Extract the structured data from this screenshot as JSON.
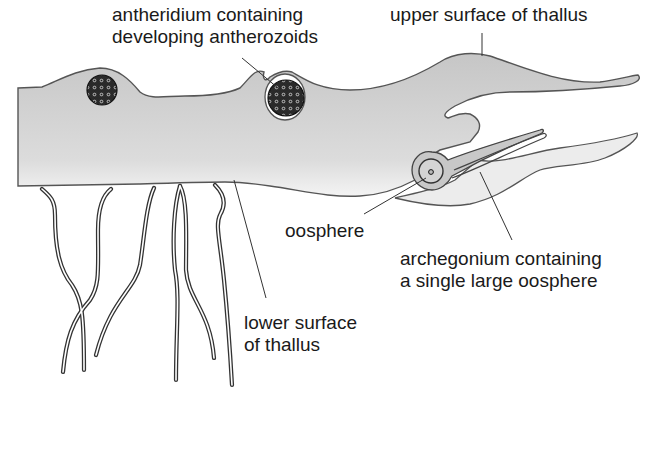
{
  "diagram": {
    "type": "biological-diagram",
    "colors": {
      "thallus_fill_top": "#c9c9c9",
      "thallus_fill_bottom": "#f2f2f2",
      "outline": "#555555",
      "leader_line": "#333333",
      "text": "#1a1a1a",
      "antheridium_fill": "#2a2a2a"
    },
    "labels": {
      "antheridium": {
        "line1": "antheridium containing",
        "line2": "developing antherozoids"
      },
      "upper_surface": {
        "line1": "upper surface of thallus"
      },
      "oosphere": {
        "line1": "oosphere"
      },
      "archegonium": {
        "line1": "archegonium containing",
        "line2": "a single large oosphere"
      },
      "lower_surface": {
        "line1": "lower surface",
        "line2": "of thallus"
      }
    }
  }
}
